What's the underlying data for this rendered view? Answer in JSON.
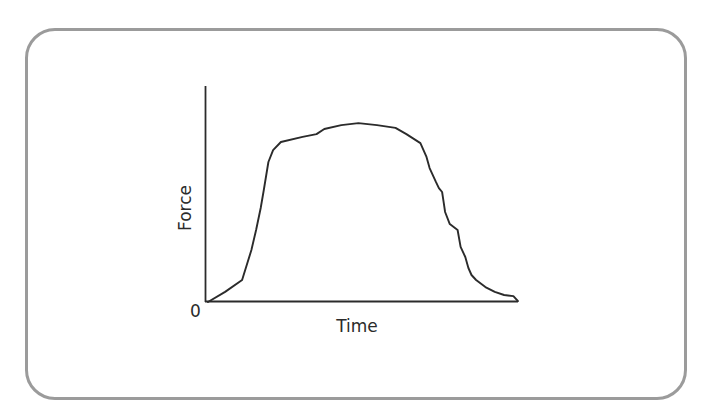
{
  "diagram": {
    "frame_border_color": "#9b9b9b",
    "line_color": "#2b2b2b",
    "axes": {
      "x_label": "Time",
      "y_label": "Force",
      "origin_label": "0"
    }
  },
  "chart_data": {
    "type": "line",
    "title": "",
    "xlabel": "Time",
    "ylabel": "Force",
    "x_ticks": [],
    "y_ticks": [
      "0"
    ],
    "grid": false,
    "legend": null,
    "note": "Qualitative force-time curve; values normalized (x: 0-100 time units, y: 0-100 force units relative to peak)",
    "xlim": [
      0,
      100
    ],
    "ylim": [
      0,
      100
    ],
    "series": [
      {
        "name": "Force",
        "x": [
          0,
          5.5,
          11,
          14,
          15.5,
          17,
          18,
          19.5,
          21,
          23.5,
          30.5,
          35,
          37.5,
          43,
          48.5,
          54.5,
          60.5,
          64,
          68.5,
          70.5,
          71.5,
          73.5,
          74.5,
          75.5,
          76,
          76.5,
          78,
          80.5,
          81.5,
          83,
          84,
          85,
          86.5,
          89.5,
          92.5,
          95.5,
          98.5,
          100
        ],
        "y": [
          0,
          5.6,
          12.2,
          28.9,
          40,
          52.2,
          62.2,
          77.8,
          84.4,
          88.9,
          91.7,
          93.3,
          96.1,
          98.3,
          99.4,
          98.3,
          96.7,
          93.3,
          88.3,
          80.6,
          74.4,
          66.7,
          63.3,
          61.1,
          55.6,
          50,
          43.3,
          40,
          30.6,
          25,
          18.9,
          15,
          12.2,
          8.3,
          5.6,
          3.9,
          3.3,
          0.5
        ]
      }
    ]
  }
}
